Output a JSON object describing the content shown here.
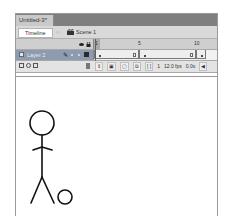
{
  "document": {
    "tab_title": "Untitled-3*"
  },
  "scene_bar": {
    "timeline_button": "Timeline",
    "scene_label": "Scene 1",
    "scene_icon": "clapperboard-icon"
  },
  "timeline": {
    "header_icons": [
      "eye-icon",
      "lock-icon",
      "outline-icon"
    ],
    "ruler_numbers": [
      "1",
      "5",
      "10"
    ],
    "layers": [
      {
        "name": "Layer 2",
        "edit_icon": "pencil-icon",
        "selected": true,
        "outline_color": "#2a2a2a"
      }
    ],
    "controls": {
      "left_icons": [
        "insert-layer-icon",
        "motion-guide-icon",
        "insert-folder-icon"
      ],
      "delete_icon": "trash-icon",
      "current_frame": "1",
      "frame_rate": "12.0 fps",
      "elapsed_time": "0.0s"
    }
  },
  "colors": {
    "tab_bar": "#7f7f7f",
    "layer_selected": "#8d9bb0",
    "playhead": "#cc3333"
  },
  "stage": {
    "content": "stick figure with ball"
  }
}
